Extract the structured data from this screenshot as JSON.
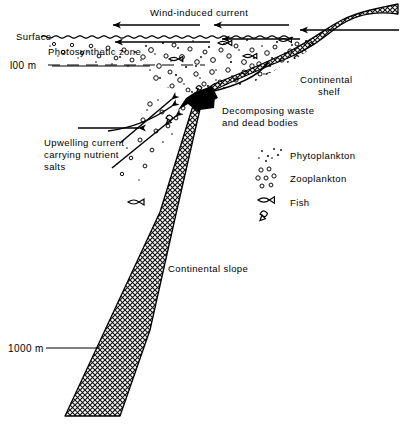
{
  "diagram": {
    "labels": {
      "surface": "Surface",
      "photosynthetic_zone": "Photosynthetic zone",
      "depth_100": "l00 m",
      "depth_1000": "1000 m",
      "wind_current": "Wind-induced current",
      "continental_shelf_line1": "Continental",
      "continental_shelf_line2": "shelf",
      "continental_slope": "Continental slope",
      "decomposing_line1": "Decomposing waste",
      "decomposing_line2": "and dead bodies",
      "upwelling_line1": "Upwelling current",
      "upwelling_line2": "carrying nutrient",
      "upwelling_line3": "salts"
    },
    "legend": {
      "items": [
        {
          "icon": "phytoplankton-dots-icon",
          "label": "Phytoplankton"
        },
        {
          "icon": "zooplankton-circles-icon",
          "label": "Zooplankton"
        },
        {
          "icon": "fish-icon",
          "label": "Fish"
        }
      ]
    },
    "colors": {
      "ink": "#000000",
      "paper": "#ffffff",
      "hatch": "#1a1a1a"
    }
  }
}
